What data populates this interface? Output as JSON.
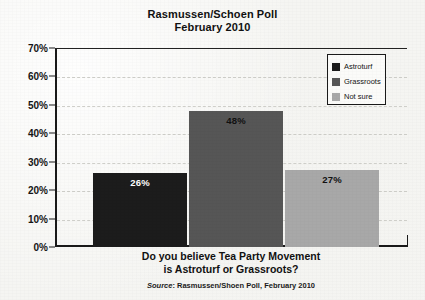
{
  "chart_data": {
    "type": "bar",
    "title": "Rasmussen/Schoen Poll",
    "subtitle": "February 2010",
    "categories": [
      "Astroturf",
      "Grassroots",
      "Not sure"
    ],
    "values": [
      26,
      48,
      27
    ],
    "value_labels": [
      "26%",
      "48%",
      "27%"
    ],
    "xlabel_line1": "Do you believe Tea Party Movement",
    "xlabel_line2": "is Astroturf or Grassroots?",
    "ylabel": "",
    "ylim": [
      0,
      70
    ],
    "ytick_labels": [
      "0%",
      "10%",
      "20%",
      "30%",
      "40%",
      "50%",
      "60%",
      "70%"
    ],
    "ytick_values": [
      0,
      10,
      20,
      30,
      40,
      50,
      60,
      70
    ],
    "grid": true,
    "legend_position": "top-right",
    "series_colors": [
      "#1c1c1c",
      "#565656",
      "#a8a8a8"
    ],
    "value_label_colors": [
      "#ffffff",
      "#111111",
      "#111111"
    ],
    "source_prefix": "Source",
    "source_text": ": Rasmussen/Shoen Poll, February 2010"
  },
  "legend": {
    "items": [
      {
        "label": "Astroturf",
        "color": "#1c1c1c"
      },
      {
        "label": "Grassroots",
        "color": "#565656"
      },
      {
        "label": "Not sure",
        "color": "#a8a8a8"
      }
    ]
  },
  "colors": {
    "background": "#f5f5f2",
    "axis": "#1a1a1a",
    "gridline": "#cfcfca",
    "text": "#111111"
  }
}
